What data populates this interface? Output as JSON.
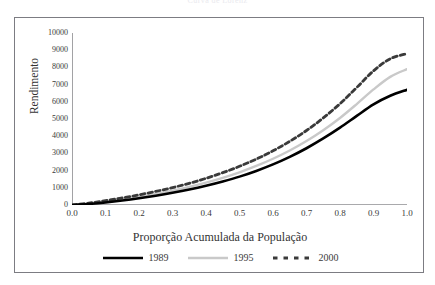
{
  "figure": {
    "title": "Curva de Lorenz"
  },
  "chart_data": {
    "type": "line",
    "title": "Curva de Lorenz",
    "xlabel": "Proporção Acumulada da População",
    "ylabel": "Rendimento",
    "xlim": [
      0.0,
      1.0
    ],
    "ylim": [
      0,
      10000
    ],
    "grid": false,
    "legend_position": "bottom",
    "xticks": [
      "0.0",
      "0.1",
      "0.2",
      "0.3",
      "0.4",
      "0.5",
      "0.6",
      "0.7",
      "0.8",
      "0.9",
      "1.0"
    ],
    "xtick_values": [
      0.0,
      0.1,
      0.2,
      0.3,
      0.4,
      0.5,
      0.6,
      0.7,
      0.8,
      0.9,
      1.0
    ],
    "yticks": [
      "0",
      "1000",
      "2000",
      "3000",
      "4000",
      "5000",
      "6000",
      "7000",
      "8000",
      "9000",
      "10000"
    ],
    "ytick_values": [
      0,
      1000,
      2000,
      3000,
      4000,
      5000,
      6000,
      7000,
      8000,
      9000,
      10000
    ],
    "x": [
      0.0,
      0.05,
      0.1,
      0.15,
      0.2,
      0.25,
      0.3,
      0.35,
      0.4,
      0.45,
      0.5,
      0.55,
      0.6,
      0.65,
      0.7,
      0.75,
      0.8,
      0.85,
      0.9,
      0.95,
      1.0
    ],
    "series": [
      {
        "name": "1989",
        "color": "#000000",
        "style": "solid",
        "width": 2.6,
        "values": [
          0,
          60,
          150,
          260,
          390,
          540,
          710,
          900,
          1120,
          1370,
          1650,
          1980,
          2360,
          2800,
          3300,
          3870,
          4500,
          5180,
          5850,
          6350,
          6700
        ]
      },
      {
        "name": "1995",
        "color": "#c9c9c9",
        "style": "solid",
        "width": 2.4,
        "values": [
          0,
          80,
          190,
          320,
          470,
          640,
          830,
          1050,
          1300,
          1580,
          1900,
          2270,
          2690,
          3170,
          3720,
          4350,
          5060,
          5870,
          6720,
          7450,
          7900
        ]
      },
      {
        "name": "2000",
        "color": "#3a3a3a",
        "style": "dashed",
        "width": 2.8,
        "values": [
          0,
          110,
          250,
          410,
          590,
          790,
          1010,
          1260,
          1550,
          1880,
          2250,
          2670,
          3150,
          3700,
          4330,
          5060,
          5890,
          6830,
          7800,
          8500,
          8800
        ]
      }
    ]
  }
}
